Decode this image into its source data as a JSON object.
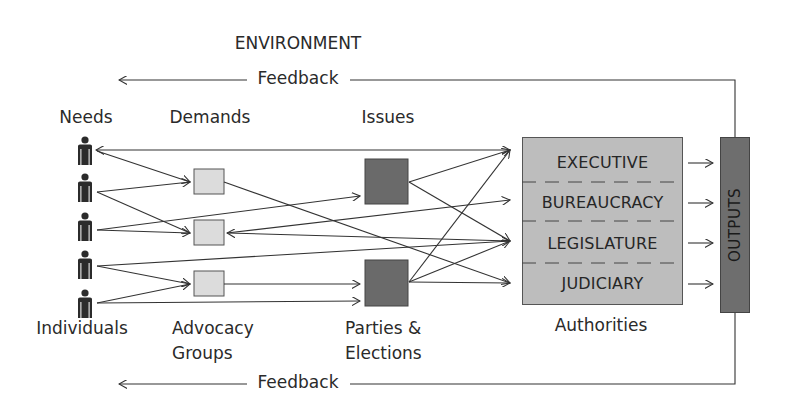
{
  "title": "ENVIRONMENT",
  "feedback": {
    "top_label": "Feedback",
    "bottom_label": "Feedback"
  },
  "columns": {
    "needs": {
      "top": "Needs",
      "bottom": "Individuals"
    },
    "demands": {
      "top": "Demands",
      "bottom_line1": "Advocacy",
      "bottom_line2": "Groups"
    },
    "issues": {
      "top": "Issues",
      "bottom_line1": "Parties &",
      "bottom_line2": "Elections"
    },
    "authorities": {
      "bottom": "Authorities"
    }
  },
  "authorities": {
    "rows": [
      "EXECUTIVE",
      "BUREAUCRACY",
      "LEGISLATURE",
      "JUDICIARY"
    ]
  },
  "outputs": {
    "label": "OUTPUTS"
  },
  "individuals_count": 5,
  "icons": {
    "person": "person-icon",
    "advocacy_group": "light-square",
    "party": "dark-square"
  },
  "colors": {
    "line": "#333333",
    "advocacy_box": "#dcdcdc",
    "party_box": "#6a6a6a",
    "authorities_box": "#bdbdbd",
    "outputs_box": "#6e6e6e"
  }
}
